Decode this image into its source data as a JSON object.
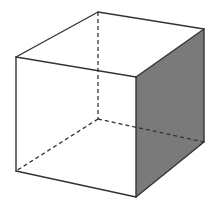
{
  "diagram": {
    "title": "",
    "type": "cube-oblique-projection",
    "colors": {
      "background": "#ffffff",
      "edge": "#333333",
      "shaded_face": "#7a7a7a"
    },
    "vertices": {
      "front_top_left": [
        16,
        57
      ],
      "front_top_right": [
        136,
        77
      ],
      "front_bottom_left": [
        16,
        171
      ],
      "front_bottom_right": [
        136,
        197
      ],
      "back_top_left": [
        98,
        12
      ],
      "back_top_right": [
        204,
        29
      ],
      "back_bottom_left": [
        98,
        119
      ],
      "back_bottom_right": [
        204,
        142
      ]
    },
    "faces": [
      {
        "name": "right-face",
        "shaded": true,
        "vertices": [
          "front_top_right",
          "back_top_right",
          "back_bottom_right",
          "front_bottom_right"
        ]
      }
    ],
    "visible_edges": [
      [
        "front_top_left",
        "front_top_right"
      ],
      [
        "front_top_right",
        "front_bottom_right"
      ],
      [
        "front_bottom_right",
        "front_bottom_left"
      ],
      [
        "front_bottom_left",
        "front_top_left"
      ],
      [
        "front_top_left",
        "back_top_left"
      ],
      [
        "back_top_left",
        "back_top_right"
      ],
      [
        "back_top_right",
        "front_top_right"
      ],
      [
        "back_top_right",
        "back_bottom_right"
      ],
      [
        "back_bottom_right",
        "front_bottom_right"
      ]
    ],
    "hidden_edges": [
      [
        "back_top_left",
        "back_bottom_left"
      ],
      [
        "back_bottom_left",
        "front_bottom_left"
      ],
      [
        "back_bottom_left",
        "back_bottom_right"
      ]
    ]
  }
}
